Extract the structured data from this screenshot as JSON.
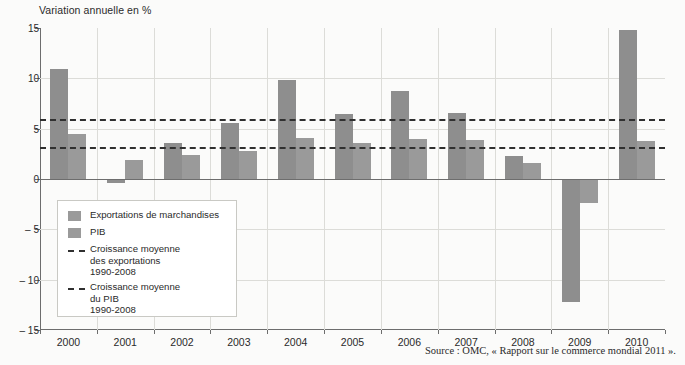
{
  "chart_data": {
    "type": "bar",
    "title": "Variation annuelle en %",
    "xlabel": "",
    "ylabel": "Variation annuelle en %",
    "ylim": [
      -15,
      15
    ],
    "yticks": [
      15,
      10,
      5,
      0,
      -5,
      -10,
      -15
    ],
    "ytick_labels": [
      "15",
      "10",
      "5",
      "0",
      "– 5",
      "– 10",
      "– 15"
    ],
    "grid": true,
    "legend_position": "inside-lower-left",
    "categories": [
      "2000",
      "2001",
      "2002",
      "2003",
      "2004",
      "2005",
      "2006",
      "2007",
      "2008",
      "2009",
      "2010"
    ],
    "series": [
      {
        "name": "Exportations de marchandises",
        "color": "#8e8e8e",
        "values": [
          10.9,
          -0.4,
          3.6,
          5.6,
          9.8,
          6.5,
          8.7,
          6.6,
          2.3,
          -12.2,
          14.8
        ]
      },
      {
        "name": "PIB",
        "color": "#9a9a9a",
        "values": [
          4.5,
          1.9,
          2.4,
          2.8,
          4.1,
          3.6,
          4.0,
          3.9,
          1.6,
          -2.4,
          3.8
        ]
      }
    ],
    "reference_lines": [
      {
        "name": "Croissance moyenne des exportations 1990-2008",
        "value": 6.0,
        "style": "dashed",
        "color": "#303030"
      },
      {
        "name": "Croissance moyenne du PIB 1990-2008",
        "value": 3.2,
        "style": "dashed",
        "color": "#303030"
      }
    ],
    "annotations": [
      "Source : OMC, « Rapport sur le commerce mondial 2011 »."
    ]
  },
  "legend": {
    "items": [
      {
        "marker": "swatch",
        "label": "Exportations de marchandises"
      },
      {
        "marker": "swatch",
        "label": "PIB"
      },
      {
        "marker": "dash",
        "label": "Croissance moyenne\ndes exportations\n1990-2008"
      },
      {
        "marker": "dash",
        "label": "Croissance moyenne\ndu PIB\n1990-2008"
      }
    ]
  },
  "source": {
    "text": "Source : OMC, « Rapport sur le commerce mondial 2011 »."
  }
}
